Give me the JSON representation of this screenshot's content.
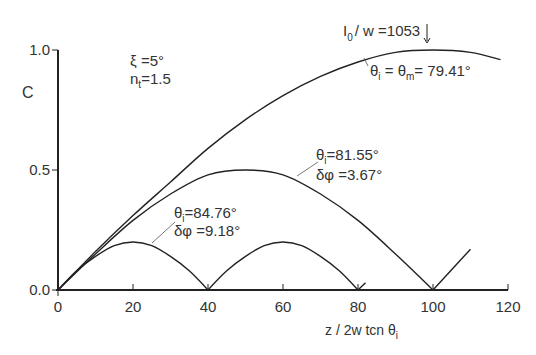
{
  "chart_data": {
    "type": "line",
    "title": "",
    "xlabel": "z / 2w tan θi",
    "ylabel": "C",
    "xlim": [
      0,
      120
    ],
    "ylim": [
      0,
      1.0
    ],
    "x_ticks": [
      0,
      20,
      40,
      60,
      80,
      100,
      120
    ],
    "y_ticks": [
      0.0,
      0.5,
      1.0
    ],
    "x_tick_labels": [
      "0",
      "20",
      "40",
      "60",
      "80",
      "100",
      "120"
    ],
    "y_tick_labels": [
      "0.0",
      "0.5",
      "1.0"
    ],
    "grid": false,
    "parameters": [
      "ξ = 5°",
      "n₁ = 1.5"
    ],
    "series": [
      {
        "name": "θi = θm = 79.41°",
        "x": [
          0,
          10,
          20,
          30,
          40,
          50,
          60,
          70,
          80,
          90,
          100,
          110,
          118
        ],
        "values": [
          0,
          0.16,
          0.31,
          0.45,
          0.59,
          0.71,
          0.81,
          0.89,
          0.95,
          0.99,
          1.0,
          0.99,
          0.96
        ]
      },
      {
        "name": "θi = 81.55°, δφ = 3.67°",
        "x": [
          0,
          10,
          20,
          30,
          40,
          50,
          60,
          70,
          80,
          90,
          100,
          110
        ],
        "values": [
          0,
          0.15,
          0.29,
          0.4,
          0.48,
          0.5,
          0.48,
          0.4,
          0.29,
          0.15,
          0,
          0.17
        ]
      },
      {
        "name": "θi = 84.76°, δφ = 9.18°",
        "x": [
          0,
          5,
          10,
          15,
          20,
          25,
          30,
          35,
          40,
          45,
          50,
          55,
          60,
          65,
          70,
          75,
          80,
          82
        ],
        "values": [
          0,
          0.08,
          0.14,
          0.185,
          0.2,
          0.185,
          0.14,
          0.08,
          0,
          0.08,
          0.14,
          0.185,
          0.2,
          0.185,
          0.14,
          0.08,
          0,
          0.03
        ]
      }
    ],
    "annotations": [
      {
        "text": "I0 / w = 1053",
        "x": 100,
        "y": 1.0,
        "arrow": "down"
      },
      {
        "text": "θi = θm = 79.41°"
      },
      {
        "text": "θi = 81.55°"
      },
      {
        "text": "δφ = 3.67°"
      },
      {
        "text": "θi = 84.76°"
      },
      {
        "text": "δφ = 9.18°"
      }
    ]
  },
  "labels": {
    "y_axis": "C",
    "x_axis_main": "z / 2w tcn θ",
    "x_axis_sub": "i",
    "param_xi": "ξ =5°",
    "param_n_main": "n",
    "param_n_sub": "t",
    "param_n_val": "=1.5",
    "ann_top_I": "I",
    "ann_top_sub": "0",
    "ann_top_rest": "/ w =1053",
    "ann_top_theta": "θ",
    "ann_top_theta_sub": "i",
    "ann_top_eq": " = θ",
    "ann_top_m": "m",
    "ann_top_val": "= 79.41°",
    "ann_mid_theta": "θ",
    "ann_mid_sub": "i",
    "ann_mid_val": "=81.55°",
    "ann_mid_dphi": "δφ =3.67°",
    "ann_low_theta": "θ",
    "ann_low_sub": "i",
    "ann_low_val": "=84.76°",
    "ann_low_dphi": "δφ =9.18°"
  }
}
